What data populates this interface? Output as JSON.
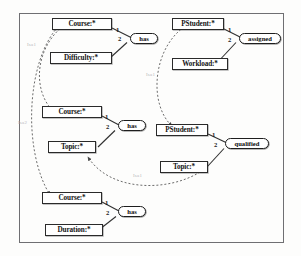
{
  "diagram": {
    "frame": {
      "border_color": "#6f6f72"
    },
    "groups": [
      {
        "id": "group-has-difficulty",
        "entity": "Course:*",
        "attribute": "Difficulty:*",
        "relation": "has",
        "port_entity": "1",
        "port_attribute": "2"
      },
      {
        "id": "group-assigned-workload",
        "entity": "PStudent:*",
        "attribute": "Workload:*",
        "relation": "assigned",
        "port_entity": "1",
        "port_attribute": "2"
      },
      {
        "id": "group-has-topic",
        "entity": "Course:*",
        "attribute": "Topic:*",
        "relation": "has",
        "port_entity": "1",
        "port_attribute": "2"
      },
      {
        "id": "group-qualified-topic",
        "entity": "PStudent:*",
        "attribute": "Topic:*",
        "relation": "qualified",
        "port_entity": "1",
        "port_attribute": "2"
      },
      {
        "id": "group-has-duration",
        "entity": "Course:*",
        "attribute": "Duration:*",
        "relation": "has",
        "port_entity": "1",
        "port_attribute": "2"
      }
    ],
    "isa_edges": [
      {
        "id": "isa-course-top-to-middle",
        "label": "Isa1"
      },
      {
        "id": "isa-course-top-to-bottom",
        "label": "Isa2"
      },
      {
        "id": "isa-pstudent-top-to-middle",
        "label": "Isa1"
      },
      {
        "id": "isa-topic-right-to-left",
        "label": "Isa1"
      }
    ],
    "colors": {
      "node_border": "#2a2a2a",
      "relation_border": "#1e1e1e",
      "edge": "#303030",
      "dashed_edge": "#5a5a5a",
      "faint_label": "#b9b9bd"
    }
  }
}
